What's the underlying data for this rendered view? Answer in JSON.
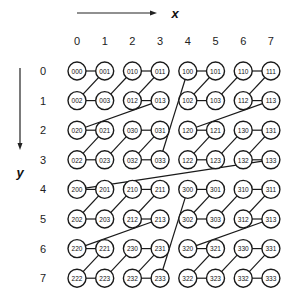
{
  "diagram": {
    "type": "z-order-curve",
    "x_axis": {
      "label": "x",
      "ticks": [
        "0",
        "1",
        "2",
        "3",
        "4",
        "5",
        "6",
        "7"
      ]
    },
    "y_axis": {
      "label": "y",
      "ticks": [
        "0",
        "1",
        "2",
        "3",
        "4",
        "5",
        "6",
        "7"
      ]
    },
    "grid": [
      [
        "000",
        "001",
        "010",
        "011",
        "100",
        "101",
        "110",
        "111"
      ],
      [
        "002",
        "003",
        "012",
        "013",
        "102",
        "103",
        "112",
        "113"
      ],
      [
        "020",
        "021",
        "030",
        "031",
        "120",
        "121",
        "130",
        "131"
      ],
      [
        "022",
        "023",
        "032",
        "033",
        "122",
        "123",
        "132",
        "133"
      ],
      [
        "200",
        "201",
        "210",
        "211",
        "300",
        "301",
        "310",
        "311"
      ],
      [
        "202",
        "203",
        "212",
        "213",
        "302",
        "303",
        "312",
        "313"
      ],
      [
        "220",
        "221",
        "230",
        "231",
        "320",
        "321",
        "330",
        "331"
      ],
      [
        "222",
        "223",
        "232",
        "233",
        "322",
        "323",
        "332",
        "333"
      ]
    ],
    "curve_order": "base-4 label ascending (000 → 333)",
    "colors": {
      "stroke": "#1a1a1a",
      "node_fill": "#ffffff",
      "text": "#111111"
    }
  }
}
